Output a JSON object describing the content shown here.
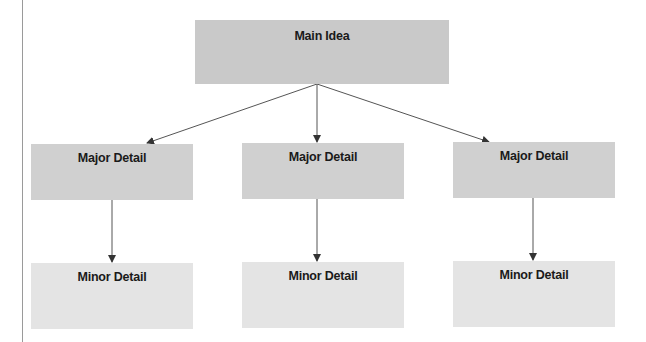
{
  "diagram": {
    "main": {
      "label": "Main Idea"
    },
    "majors": [
      {
        "label": "Major Detail"
      },
      {
        "label": "Major Detail"
      },
      {
        "label": "Major Detail"
      }
    ],
    "minors": [
      {
        "label": "Minor Detail"
      },
      {
        "label": "Minor Detail"
      },
      {
        "label": "Minor Detail"
      }
    ]
  },
  "colors": {
    "main_fill": "#c9c9c9",
    "major_fill": "#d0d0d0",
    "minor_fill": "#e4e4e4",
    "arrow": "#444444"
  }
}
